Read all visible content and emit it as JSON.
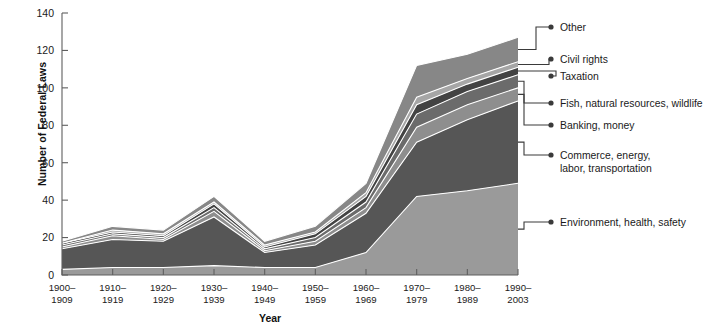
{
  "chart_data": {
    "type": "area",
    "stacked": true,
    "title": "",
    "xlabel": "Year",
    "ylabel": "Number of Federal Laws",
    "ylim": [
      0,
      140
    ],
    "yticks": [
      0,
      20,
      40,
      60,
      80,
      100,
      120,
      140
    ],
    "grid": false,
    "legend_position": "right-leader-lines",
    "categories": [
      "1900–\n1909",
      "1910–\n1919",
      "1920–\n1929",
      "1930–\n1939",
      "1940–\n1949",
      "1950–\n1959",
      "1960–\n1969",
      "1970–\n1979",
      "1980–\n1989",
      "1990–\n2003"
    ],
    "category_lines": [
      [
        "1900–",
        "1909"
      ],
      [
        "1910–",
        "1919"
      ],
      [
        "1920–",
        "1929"
      ],
      [
        "1930–",
        "1939"
      ],
      [
        "1940–",
        "1949"
      ],
      [
        "1950–",
        "1959"
      ],
      [
        "1960–",
        "1969"
      ],
      [
        "1970–",
        "1979"
      ],
      [
        "1980–",
        "1989"
      ],
      [
        "1990–",
        "2003"
      ]
    ],
    "series": [
      {
        "name": "Environment, health, safety",
        "color": "#9a9a9a",
        "values": [
          3,
          4,
          4,
          5,
          4,
          4,
          12,
          42,
          45,
          49
        ]
      },
      {
        "name": "Commerce, energy, labor, transportation",
        "color": "#565656",
        "values": [
          11,
          15,
          14,
          26,
          8,
          12,
          21,
          29,
          38,
          44
        ]
      },
      {
        "name": "Banking, money",
        "color": "#8e8e8e",
        "values": [
          1,
          2,
          1,
          3,
          1,
          2,
          3,
          8,
          8,
          7
        ]
      },
      {
        "name": "Fish, natural resources, wildlife",
        "color": "#6b6b6b",
        "values": [
          1,
          1,
          1,
          2,
          1,
          2,
          3,
          7,
          7,
          7
        ]
      },
      {
        "name": "Taxation",
        "color": "#434343",
        "values": [
          1,
          1,
          1,
          2,
          1,
          2,
          3,
          5,
          4,
          4
        ]
      },
      {
        "name": "Civil rights",
        "color": "#a6a6a6",
        "values": [
          0,
          1,
          1,
          1,
          1,
          1,
          2,
          4,
          3,
          3
        ]
      },
      {
        "name": "Other",
        "color": "#878787",
        "values": [
          1,
          2,
          2,
          3,
          2,
          3,
          5,
          17,
          13,
          13
        ]
      }
    ],
    "totals": [
      18,
      26,
      24,
      42,
      18,
      26,
      49,
      112,
      118,
      127
    ],
    "legend_labels": [
      {
        "label": "Other",
        "lines": [
          "Other"
        ]
      },
      {
        "label": "Civil rights",
        "lines": [
          "Civil rights"
        ]
      },
      {
        "label": "Taxation",
        "lines": [
          "Taxation"
        ]
      },
      {
        "label": "Fish, natural resources, wildlife",
        "lines": [
          "Fish, natural resources, wildlife"
        ]
      },
      {
        "label": "Banking, money",
        "lines": [
          "Banking, money"
        ]
      },
      {
        "label": "Commerce, energy, labor, transportation",
        "lines": [
          "Commerce, energy,",
          "labor, transportation"
        ]
      },
      {
        "label": "Environment, health, safety",
        "lines": [
          "Environment, health, safety"
        ]
      }
    ]
  }
}
